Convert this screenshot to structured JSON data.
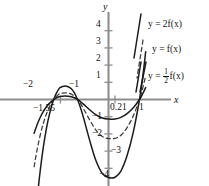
{
  "figure": {
    "axes": {
      "x_axis_label": "x",
      "y_axis_label": "y",
      "x_tick_labels": [
        "−2",
        "−1",
        "1"
      ],
      "y_tick_labels_positive": [
        "1",
        "2",
        "3",
        "4"
      ],
      "y_tick_labels_negative": [
        "−1",
        "−2",
        "−3",
        "−4"
      ],
      "annotation_left": "−1.55",
      "annotation_right": "0.21"
    },
    "legend": {
      "items": [
        {
          "prefix": "y = ",
          "coef": "2",
          "fn": "f(x)",
          "style": "solid",
          "name": "y-equals-2fx"
        },
        {
          "prefix": "y = ",
          "coef": "",
          "fn": "f(x)",
          "style": "dashed",
          "name": "y-equals-fx"
        },
        {
          "prefix": "y = ",
          "coef": "½",
          "fn": "f(x)",
          "style": "solid",
          "name": "y-equals-half-fx"
        }
      ],
      "label_2f": "y = 2f(x)",
      "label_f": "y = f(x)",
      "label_half_f_pre": "y = ",
      "label_half_f_num": "1",
      "label_half_f_den": "2",
      "label_half_f_post": "f(x)"
    },
    "colors": {
      "curve": "#1b1b1b",
      "axis": "#8e8e8e",
      "background": "#ffffff"
    }
  },
  "chart_data": {
    "type": "line",
    "title": "",
    "xlabel": "x",
    "ylabel": "y",
    "xlim": [
      -2.45,
      1.35
    ],
    "ylim": [
      -4.6,
      4.8
    ],
    "grid": false,
    "legend_position": "right",
    "x_ticks": [
      -2,
      -1,
      1
    ],
    "y_ticks": [
      -4,
      -3,
      -2,
      -1,
      1,
      2,
      3,
      4
    ],
    "annotations": [
      {
        "text": "−1.55",
        "x": -1.55,
        "y": 0,
        "note": "local max location of f"
      },
      {
        "text": "0.21",
        "x": 0.21,
        "y": 0,
        "note": "local min location of f"
      }
    ],
    "roots": [
      -2,
      -1,
      1
    ],
    "series": [
      {
        "name": "y = 2f(x)",
        "style": "solid",
        "scale": 2,
        "x": [
          -2.4,
          -2.3,
          -2.2,
          -2.1,
          -2.0,
          -1.9,
          -1.8,
          -1.7,
          -1.6,
          -1.55,
          -1.5,
          -1.4,
          -1.3,
          -1.2,
          -1.1,
          -1.0,
          -0.9,
          -0.8,
          -0.6,
          -0.4,
          -0.2,
          0.0,
          0.21,
          0.4,
          0.6,
          0.8,
          1.0,
          1.1,
          1.2
        ],
        "y": [
          -7.82,
          -5.78,
          -4.1,
          -2.74,
          -1.66,
          -0.82,
          -0.18,
          0.3,
          0.62,
          0.71,
          0.74,
          0.78,
          0.74,
          0.62,
          0.38,
          0.0,
          -0.5,
          -1.1,
          -2.42,
          -3.58,
          -4.3,
          -4.54,
          -4.52,
          -4.16,
          -3.26,
          -1.9,
          0.0,
          1.26,
          2.78
        ]
      },
      {
        "name": "y = f(x)",
        "style": "dashed",
        "scale": 1,
        "x": [
          -2.4,
          -2.3,
          -2.2,
          -2.1,
          -2.0,
          -1.9,
          -1.8,
          -1.7,
          -1.6,
          -1.55,
          -1.5,
          -1.4,
          -1.3,
          -1.2,
          -1.1,
          -1.0,
          -0.9,
          -0.8,
          -0.6,
          -0.4,
          -0.2,
          0.0,
          0.21,
          0.4,
          0.6,
          0.8,
          1.0,
          1.1,
          1.2
        ],
        "y": [
          -3.91,
          -2.89,
          -2.05,
          -1.37,
          -0.83,
          -0.41,
          -0.09,
          0.15,
          0.31,
          0.355,
          0.37,
          0.39,
          0.37,
          0.31,
          0.19,
          0.0,
          -0.25,
          -0.55,
          -1.21,
          -1.79,
          -2.15,
          -2.27,
          -2.26,
          -2.08,
          -1.63,
          -0.95,
          0.0,
          0.63,
          1.39
        ]
      },
      {
        "name": "y = ½f(x)",
        "style": "solid",
        "scale": 0.5,
        "x": [
          -2.4,
          -2.3,
          -2.2,
          -2.1,
          -2.0,
          -1.9,
          -1.8,
          -1.7,
          -1.6,
          -1.55,
          -1.5,
          -1.4,
          -1.3,
          -1.2,
          -1.1,
          -1.0,
          -0.9,
          -0.8,
          -0.6,
          -0.4,
          -0.2,
          0.0,
          0.21,
          0.4,
          0.6,
          0.8,
          1.0,
          1.1,
          1.2
        ],
        "y": [
          -1.96,
          -1.45,
          -1.03,
          -0.69,
          -0.42,
          -0.21,
          -0.05,
          0.08,
          0.16,
          0.18,
          0.19,
          0.2,
          0.19,
          0.16,
          0.1,
          0.0,
          -0.13,
          -0.28,
          -0.61,
          -0.9,
          -1.08,
          -1.14,
          -1.13,
          -1.04,
          -0.82,
          -0.48,
          0.0,
          0.32,
          0.7
        ]
      }
    ]
  }
}
